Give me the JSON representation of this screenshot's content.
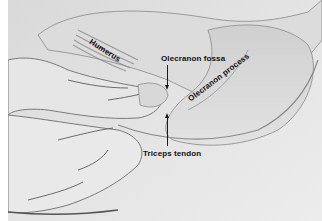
{
  "figure": {
    "labels": {
      "humerus": "Humerus",
      "olecranon_fossa": "Olecranon fossa",
      "olecranon_process": "Olecranon process",
      "triceps_tendon": "Triceps tendon"
    },
    "arrows": [
      {
        "label": "Olecranon fossa",
        "direction": "down"
      },
      {
        "label": "Triceps tendon",
        "direction": "up"
      }
    ],
    "colors": {
      "background": "#ffffff",
      "skin_light": "#e6e6e6",
      "skin_mid": "#cfcfcf",
      "shadow": "#7a7a7a",
      "text": "#111111"
    }
  }
}
